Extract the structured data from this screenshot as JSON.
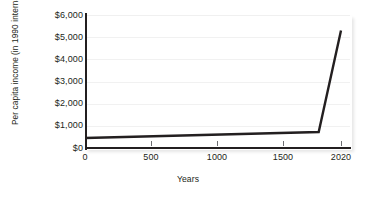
{
  "chart_data": {
    "type": "line",
    "title": "",
    "xlabel": "Years",
    "ylabel_line1": "Per capita income",
    "ylabel_line2": "(in 1990 international dollars)",
    "ylabel": "Per capita income (in 1990 international dollars)",
    "xlim": [
      0,
      2020
    ],
    "ylim": [
      0,
      6000
    ],
    "grid": true,
    "legend": false,
    "legend_position": "none",
    "line_color": "#231f20",
    "grid_color": "#f1f1f1",
    "axis_color": "#231f20",
    "background": "#ffffff",
    "yticks": [
      0,
      1000,
      2000,
      3000,
      4000,
      5000,
      6000
    ],
    "ytick_labels": [
      "$0",
      "$1,000",
      "$2,000",
      "$3,000",
      "$4,000",
      "$5,000",
      "$6,000"
    ],
    "xticks": [
      0,
      500,
      1000,
      1500,
      2020
    ],
    "xtick_labels": [
      "0",
      "500",
      "1000",
      "1500",
      "2020"
    ],
    "series": [
      {
        "name": "Per capita income",
        "x": [
          0,
          1820,
          2020
        ],
        "values": [
          450,
          720,
          5300
        ]
      }
    ],
    "points": [
      {
        "x": 0,
        "y": 450
      },
      {
        "x": 1820,
        "y": 720
      },
      {
        "x": 2020,
        "y": 5300
      }
    ]
  }
}
